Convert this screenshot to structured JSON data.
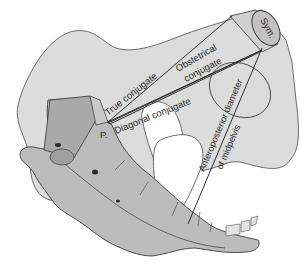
{
  "figure": {
    "type": "anatomical-diagram"
  },
  "labels": {
    "symphysis": "Sym.",
    "promontory": "P.",
    "true_conjugate": "True conjugate",
    "obstetrical_line1": "Obstetrical",
    "obstetrical_line2": "conjugate",
    "diagonal_conjugate": "Diagonal conjugate",
    "ap_line1": "Anteroposterior diameter",
    "ap_line2": "of midpelvis"
  },
  "colors": {
    "background": "#ffffff",
    "bone_light": "#d9d9d9",
    "bone_mid": "#bdbdbd",
    "bone_dark": "#a8a8a8",
    "symphysis_fill": "#c4c4c4",
    "line": "#2e2e2e"
  }
}
